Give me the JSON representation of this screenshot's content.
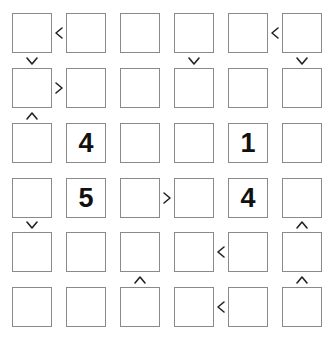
{
  "puzzle": {
    "type": "futoshiki",
    "size": 6,
    "grid": [
      [
        "",
        "",
        "",
        "",
        "",
        ""
      ],
      [
        "",
        "",
        "",
        "",
        "",
        ""
      ],
      [
        "",
        "4",
        "",
        "",
        "1",
        ""
      ],
      [
        "",
        "5",
        "",
        "",
        "4",
        ""
      ],
      [
        "",
        "",
        "",
        "",
        "",
        ""
      ],
      [
        "",
        "",
        "",
        "",
        "",
        ""
      ]
    ],
    "horizontal_signs": [
      {
        "row": 0,
        "col": 0,
        "sign": "<"
      },
      {
        "row": 0,
        "col": 4,
        "sign": "<"
      },
      {
        "row": 1,
        "col": 0,
        "sign": ">"
      },
      {
        "row": 3,
        "col": 2,
        "sign": ">"
      },
      {
        "row": 4,
        "col": 3,
        "sign": "<"
      },
      {
        "row": 5,
        "col": 3,
        "sign": "<"
      }
    ],
    "vertical_signs": [
      {
        "row": 0,
        "col": 0,
        "sign": "v"
      },
      {
        "row": 0,
        "col": 3,
        "sign": "v"
      },
      {
        "row": 0,
        "col": 5,
        "sign": "v"
      },
      {
        "row": 1,
        "col": 0,
        "sign": "^"
      },
      {
        "row": 3,
        "col": 0,
        "sign": "v"
      },
      {
        "row": 3,
        "col": 5,
        "sign": "^"
      },
      {
        "row": 4,
        "col": 2,
        "sign": "^"
      },
      {
        "row": 4,
        "col": 5,
        "sign": "^"
      }
    ]
  },
  "colors": {
    "cell_border": "#8a8a8a",
    "sign": "#222222",
    "given_digit": "#111111",
    "background": "#ffffff"
  }
}
